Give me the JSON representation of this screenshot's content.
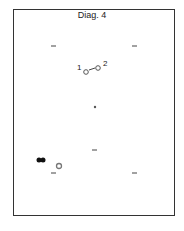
{
  "diagram": {
    "title": "Diag. 4",
    "node_labels": [
      "1",
      "2"
    ],
    "colors": {
      "frame": "#333333",
      "ink": "#222222",
      "gray_marker": "#777777"
    }
  }
}
